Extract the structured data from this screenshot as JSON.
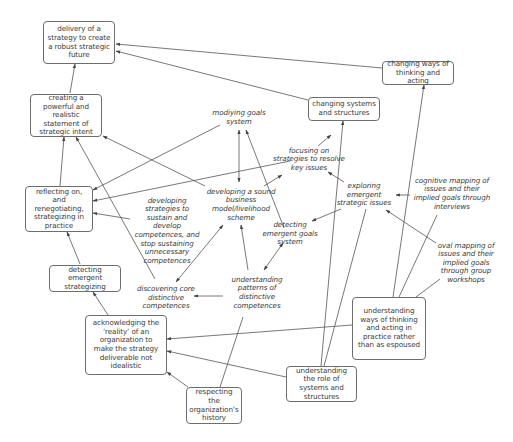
{
  "diagram": {
    "type": "cognitive-map",
    "colors": {
      "line": "#555555",
      "box_border": "#6d6d6d",
      "text": "#3a3a3a",
      "background": "#ffffff"
    },
    "nodes": [
      {
        "id": "n1",
        "style": "box",
        "text": "delivery of a strategy to create a robust strategic future"
      },
      {
        "id": "n2",
        "style": "box",
        "text": "changing ways of thinking and acting"
      },
      {
        "id": "n3",
        "style": "box",
        "text": "creating a powerful and realistic statement of strategic intent"
      },
      {
        "id": "n4",
        "style": "box",
        "text": "changing systems and structures"
      },
      {
        "id": "n5",
        "style": "free",
        "text": "modiying goals system"
      },
      {
        "id": "n6",
        "style": "free",
        "text": "focusing on strategies to resolve key issues"
      },
      {
        "id": "n7",
        "style": "box",
        "text": "reflecting on, and renegotiating, strategizing in practice"
      },
      {
        "id": "n8",
        "style": "free",
        "text": "developing a sound business model/livelihood scheme"
      },
      {
        "id": "n9",
        "style": "free",
        "text": "exploring emergent strategic issues"
      },
      {
        "id": "n10",
        "style": "free",
        "text": "cognitive mapping of issues and their implied goals through interviews"
      },
      {
        "id": "n11",
        "style": "free",
        "text": "developing strategies to sustain and develop competences, and stop sustaining unnecessary competences"
      },
      {
        "id": "n12",
        "style": "free",
        "text": "detecting emergent goals system"
      },
      {
        "id": "n13",
        "style": "free",
        "text": "oval mapping of issues and their implied goals through group workshops"
      },
      {
        "id": "n14",
        "style": "box",
        "text": "detecting emergent strategizing"
      },
      {
        "id": "n15",
        "style": "free",
        "text": "understanding patterns of distinctive competences"
      },
      {
        "id": "n16",
        "style": "free",
        "text": "discovering core distinctive competences"
      },
      {
        "id": "n17",
        "style": "box",
        "text": "understanding ways of thinking and acting in practice rather than as espoused"
      },
      {
        "id": "n18",
        "style": "box",
        "text": "acknowledging the ‘reality’ of an organization to make the strategy deliverable not idealistic"
      },
      {
        "id": "n19",
        "style": "box",
        "text": "understanding the role of systems and structures"
      },
      {
        "id": "n20",
        "style": "box",
        "text": "respecting the organization’s history"
      }
    ],
    "edges": [
      {
        "from": "n3",
        "to": "n1"
      },
      {
        "from": "n2",
        "to": "n1"
      },
      {
        "from": "n4",
        "to": "n1"
      },
      {
        "from": "n7",
        "to": "n3"
      },
      {
        "from": "n8",
        "to": "n3"
      },
      {
        "from": "n16",
        "to": "n3"
      },
      {
        "from": "n5",
        "to": "n7"
      },
      {
        "from": "n6",
        "to": "n7"
      },
      {
        "from": "n11",
        "to": "n7"
      },
      {
        "from": "n14",
        "to": "n7"
      },
      {
        "from": "n18",
        "to": "n14"
      },
      {
        "from": "n5",
        "to": "n8",
        "bidirectional": true
      },
      {
        "from": "n12",
        "to": "n5"
      },
      {
        "from": "n8",
        "to": "n6"
      },
      {
        "from": "n6",
        "to": "n4"
      },
      {
        "from": "n9",
        "to": "n6"
      },
      {
        "from": "n9",
        "to": "n12"
      },
      {
        "from": "n10",
        "to": "n9"
      },
      {
        "from": "n13",
        "to": "n9"
      },
      {
        "from": "n12",
        "to": "n15",
        "bidirectional": true
      },
      {
        "from": "n15",
        "to": "n8"
      },
      {
        "from": "n15",
        "to": "n16"
      },
      {
        "from": "n8",
        "to": "n16",
        "bidirectional": true
      },
      {
        "from": "n19",
        "to": "n4"
      },
      {
        "from": "n19",
        "to": "n9"
      },
      {
        "from": "n17",
        "to": "n2"
      },
      {
        "from": "n17",
        "to": "n10"
      },
      {
        "from": "n17",
        "to": "n13"
      },
      {
        "from": "n17",
        "to": "n18"
      },
      {
        "from": "n19",
        "to": "n18"
      },
      {
        "from": "n20",
        "to": "n18"
      },
      {
        "from": "n20",
        "to": "n15"
      }
    ]
  }
}
